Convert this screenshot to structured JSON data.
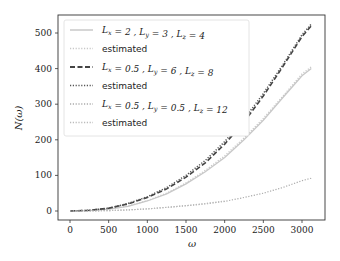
{
  "chart_data": {
    "type": "line",
    "title": "",
    "xlabel": "ω",
    "ylabel": "N(ω)",
    "xlim": [
      -150,
      3300
    ],
    "ylim": [
      -25,
      550
    ],
    "xticks": [
      0,
      500,
      1000,
      1500,
      2000,
      2500,
      3000
    ],
    "yticks": [
      0,
      100,
      200,
      300,
      400,
      500
    ],
    "grid": false,
    "legend_position": "upper left",
    "x": [
      0,
      250,
      500,
      750,
      1000,
      1250,
      1500,
      1750,
      2000,
      2250,
      2500,
      2750,
      3000,
      3120
    ],
    "series": [
      {
        "name": "L_x = 2, L_y = 3, L_z = 4",
        "style": "solid",
        "color": "#c8c8c8",
        "values": [
          0,
          1,
          5,
          13,
          28,
          48,
          76,
          110,
          150,
          200,
          255,
          318,
          380,
          400
        ]
      },
      {
        "name": "estimated",
        "style": "dotted",
        "color": "#c8c8c8",
        "values": [
          0,
          1,
          5,
          14,
          29,
          50,
          79,
          114,
          155,
          205,
          260,
          322,
          385,
          405
        ]
      },
      {
        "name": "L_x = 0.5, L_y = 6, L_z = 8",
        "style": "dashed",
        "color": "#444444",
        "values": [
          0,
          2,
          8,
          20,
          38,
          62,
          95,
          135,
          188,
          250,
          323,
          405,
          490,
          520
        ]
      },
      {
        "name": "estimated",
        "style": "dotted",
        "color": "#555555",
        "values": [
          0,
          2,
          8,
          21,
          40,
          66,
          100,
          142,
          195,
          258,
          330,
          410,
          495,
          525
        ]
      },
      {
        "name": "L_x = 0.5, L_y = 0.5, L_z = 12",
        "style": "dotted",
        "color": "#aaaaaa",
        "values": [
          0,
          0,
          1,
          3,
          6,
          10,
          15,
          20,
          27,
          38,
          50,
          66,
          85,
          92
        ]
      },
      {
        "name": "estimated",
        "style": "dotted",
        "color": "#bbbbbb",
        "values": [
          0,
          0,
          1,
          3,
          6,
          10,
          15,
          21,
          28,
          null,
          null,
          null,
          null,
          null
        ]
      }
    ]
  },
  "legend": {
    "items": [
      {
        "label": "L_x = 2 , L_y = 3 , L_z = 4",
        "main": "L",
        "s1": "x",
        "m1": " = 2 , L",
        "s2": "y",
        "m2": " = 3 , L",
        "s3": "z",
        "m3": " = 4"
      },
      {
        "label": "estimated"
      },
      {
        "label": "L_x = 0.5 , L_y = 6 , L_z = 8",
        "main": "L",
        "s1": "x",
        "m1": " = 0.5 , L",
        "s2": "y",
        "m2": " = 6 , L",
        "s3": "z",
        "m3": " = 8"
      },
      {
        "label": "estimated"
      },
      {
        "label": "L_x = 0.5 , L_y = 0.5 , L_z = 12",
        "main": "L",
        "s1": "x",
        "m1": " = 0.5 , L",
        "s2": "y",
        "m2": " = 0.5 , L",
        "s3": "z",
        "m3": " = 12"
      },
      {
        "label": "estimated"
      }
    ]
  },
  "axes": {
    "xlabel": "ω",
    "ylabel": "N(ω)",
    "xticks": [
      "0",
      "500",
      "1000",
      "1500",
      "2000",
      "2500",
      "3000"
    ],
    "yticks": [
      "0",
      "100",
      "200",
      "300",
      "400",
      "500"
    ]
  }
}
